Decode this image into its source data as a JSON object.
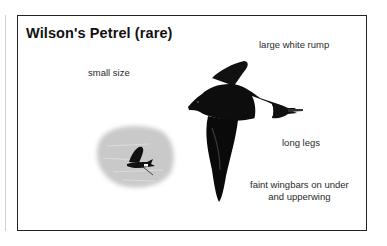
{
  "card": {
    "title": "Wilson's Petrel (rare)",
    "labels": {
      "small_size": "small size",
      "rump": "large white rump",
      "legs": "long legs",
      "wingbars_line1": "faint wingbars on under",
      "wingbars_line2": "and upperwing"
    }
  },
  "illustrations": {
    "main_bird": "wilsons-petrel-flight-illustration",
    "small_bird": "wilsons-petrel-at-sea-thumbnail"
  },
  "colors": {
    "border": "#222222",
    "bird": "#0d0d0d",
    "rump": "#ffffff",
    "sea": "#c8c8c8"
  }
}
